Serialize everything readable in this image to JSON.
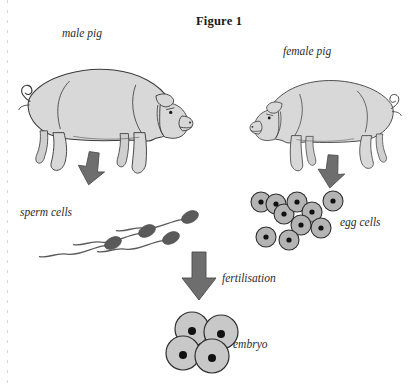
{
  "figure": {
    "title": "Figure 1",
    "title_pos": {
      "x": 196,
      "y": 14
    }
  },
  "labels": {
    "male_pig": "male pig",
    "female_pig": "female pig",
    "sperm_cells": "sperm cells",
    "egg_cells": "egg cells",
    "fertilisation": "fertilisation",
    "embryo": "embryo"
  },
  "label_positions": {
    "male_pig": {
      "x": 62,
      "y": 27
    },
    "female_pig": {
      "x": 283,
      "y": 45
    },
    "sperm_cells": {
      "x": 20,
      "y": 206
    },
    "egg_cells": {
      "x": 340,
      "y": 216
    },
    "fertilisation": {
      "x": 222,
      "y": 272
    },
    "embryo": {
      "x": 233,
      "y": 338
    }
  },
  "colors": {
    "pig_fill": "#d8d8d8",
    "pig_outline": "#3a3a3a",
    "arrow_fill": "#6e6e6e",
    "arrow_outline": "#4a4a4a",
    "sperm_head": "#5a5a5a",
    "sperm_tail": "#5a5a5a",
    "egg_fill": "#b4b4b4",
    "egg_outline": "#2e2e2e",
    "nucleus": "#111111",
    "embryo_fill": "#c8c8c8",
    "embryo_outline": "#2e2e2e",
    "text": "#2b2b2b",
    "title_text": "#1a1a1a",
    "background": "#ffffff"
  },
  "diagram": {
    "type": "biology-process-flow",
    "process": "sexual reproduction in pigs",
    "steps": [
      {
        "stage": "male pig",
        "produces": "sperm cells"
      },
      {
        "stage": "female pig",
        "produces": "egg cells"
      },
      {
        "stage": "fertilisation",
        "produces": "embryo"
      }
    ],
    "arrows": [
      {
        "name": "male-to-sperm",
        "from": "male pig",
        "to": "sperm cells",
        "direction": "down",
        "size": "small",
        "x": 78,
        "y": 152,
        "w": 27,
        "h": 33
      },
      {
        "name": "female-to-egg",
        "from": "female pig",
        "to": "egg cells",
        "direction": "down",
        "size": "small",
        "x": 318,
        "y": 155,
        "w": 27,
        "h": 33
      },
      {
        "name": "fertilisation",
        "from": "sperm cells and egg cells",
        "to": "embryo",
        "direction": "down",
        "size": "large",
        "x": 182,
        "y": 252,
        "w": 34,
        "h": 48
      }
    ]
  },
  "pigs": [
    {
      "name": "male-pig",
      "facing": "right",
      "x": 18,
      "y": 48,
      "width": 170,
      "height": 105
    },
    {
      "name": "female-pig",
      "facing": "left",
      "x": 252,
      "y": 62,
      "width": 150,
      "height": 92
    }
  ],
  "sperm_cells": {
    "count": 4,
    "head_rx": 9,
    "head_ry": 5.5,
    "items": [
      {
        "cx": 113,
        "cy": 243,
        "angle": -28
      },
      {
        "cx": 147,
        "cy": 231,
        "angle": -28
      },
      {
        "cx": 171,
        "cy": 238,
        "angle": -28
      },
      {
        "cx": 190,
        "cy": 217,
        "angle": -28
      }
    ]
  },
  "egg_cells": {
    "count": 10,
    "radius": 10,
    "nucleus_radius": 2.6,
    "items": [
      {
        "cx": 261,
        "cy": 202
      },
      {
        "cx": 276,
        "cy": 204
      },
      {
        "cx": 284,
        "cy": 214
      },
      {
        "cx": 297,
        "cy": 202
      },
      {
        "cx": 312,
        "cy": 212
      },
      {
        "cx": 333,
        "cy": 201
      },
      {
        "cx": 321,
        "cy": 228
      },
      {
        "cx": 289,
        "cy": 240
      },
      {
        "cx": 266,
        "cy": 237
      },
      {
        "cx": 301,
        "cy": 225
      }
    ]
  },
  "embryo": {
    "cell_count": 4,
    "radius": 17,
    "nucleus_radius": 4,
    "items": [
      {
        "cx": 192,
        "cy": 329
      },
      {
        "cx": 221,
        "cy": 332
      },
      {
        "cx": 183,
        "cy": 353
      },
      {
        "cx": 212,
        "cy": 356
      }
    ]
  }
}
